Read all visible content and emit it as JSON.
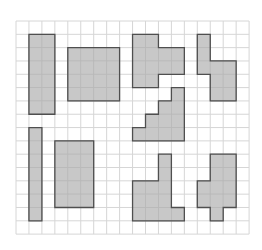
{
  "grid": {
    "origin_x": 16,
    "origin_y": 21,
    "cell_w": 12.95,
    "cell_h": 13.32,
    "cols": 18,
    "rows": 16,
    "line_color": "#d6d6d6",
    "background": "#ffffff"
  },
  "style": {
    "fill": "#c8c8c8",
    "cell_line": "#b9b9b9",
    "outline": "#4f4f4f"
  },
  "shapes": [
    {
      "id": "tall-rectangle",
      "cells": [
        [
          1,
          1
        ],
        [
          2,
          1
        ],
        [
          1,
          2
        ],
        [
          2,
          2
        ],
        [
          1,
          3
        ],
        [
          2,
          3
        ],
        [
          1,
          4
        ],
        [
          2,
          4
        ],
        [
          1,
          5
        ],
        [
          2,
          5
        ],
        [
          1,
          6
        ],
        [
          2,
          6
        ]
      ]
    },
    {
      "id": "square",
      "cells": [
        [
          4,
          2
        ],
        [
          5,
          2
        ],
        [
          6,
          2
        ],
        [
          7,
          2
        ],
        [
          4,
          3
        ],
        [
          5,
          3
        ],
        [
          6,
          3
        ],
        [
          7,
          3
        ],
        [
          4,
          4
        ],
        [
          5,
          4
        ],
        [
          6,
          4
        ],
        [
          7,
          4
        ],
        [
          4,
          5
        ],
        [
          5,
          5
        ],
        [
          6,
          5
        ],
        [
          7,
          5
        ]
      ]
    },
    {
      "id": "t-shape",
      "cells": [
        [
          9,
          1
        ],
        [
          10,
          1
        ],
        [
          9,
          2
        ],
        [
          10,
          2
        ],
        [
          11,
          2
        ],
        [
          12,
          2
        ],
        [
          9,
          3
        ],
        [
          10,
          3
        ],
        [
          11,
          3
        ],
        [
          12,
          3
        ],
        [
          9,
          4
        ],
        [
          10,
          4
        ]
      ]
    },
    {
      "id": "step-shape-top-right",
      "cells": [
        [
          14,
          1
        ],
        [
          14,
          2
        ],
        [
          14,
          3
        ],
        [
          15,
          3
        ],
        [
          16,
          3
        ],
        [
          15,
          4
        ],
        [
          16,
          4
        ],
        [
          15,
          5
        ],
        [
          16,
          5
        ]
      ]
    },
    {
      "id": "staircase",
      "cells": [
        [
          12,
          5
        ],
        [
          11,
          6
        ],
        [
          12,
          6
        ],
        [
          10,
          7
        ],
        [
          11,
          7
        ],
        [
          12,
          7
        ],
        [
          9,
          8
        ],
        [
          10,
          8
        ],
        [
          11,
          8
        ],
        [
          12,
          8
        ]
      ]
    },
    {
      "id": "thin-rectangle",
      "cells": [
        [
          1,
          8
        ],
        [
          1,
          9
        ],
        [
          1,
          10
        ],
        [
          1,
          11
        ],
        [
          1,
          12
        ],
        [
          1,
          13
        ],
        [
          1,
          14
        ]
      ]
    },
    {
      "id": "rectangle",
      "cells": [
        [
          3,
          9
        ],
        [
          4,
          9
        ],
        [
          5,
          9
        ],
        [
          3,
          10
        ],
        [
          4,
          10
        ],
        [
          5,
          10
        ],
        [
          3,
          11
        ],
        [
          4,
          11
        ],
        [
          5,
          11
        ],
        [
          3,
          12
        ],
        [
          4,
          12
        ],
        [
          5,
          12
        ],
        [
          3,
          13
        ],
        [
          4,
          13
        ],
        [
          5,
          13
        ]
      ]
    },
    {
      "id": "l-shape",
      "cells": [
        [
          11,
          10
        ],
        [
          11,
          11
        ],
        [
          9,
          12
        ],
        [
          10,
          12
        ],
        [
          11,
          12
        ],
        [
          9,
          13
        ],
        [
          10,
          13
        ],
        [
          11,
          13
        ],
        [
          9,
          14
        ],
        [
          10,
          14
        ],
        [
          11,
          14
        ],
        [
          12,
          14
        ]
      ]
    },
    {
      "id": "cross-shape",
      "cells": [
        [
          15,
          10
        ],
        [
          16,
          10
        ],
        [
          15,
          11
        ],
        [
          16,
          11
        ],
        [
          14,
          12
        ],
        [
          15,
          12
        ],
        [
          16,
          12
        ],
        [
          14,
          13
        ],
        [
          15,
          13
        ],
        [
          16,
          13
        ],
        [
          15,
          14
        ]
      ]
    }
  ]
}
